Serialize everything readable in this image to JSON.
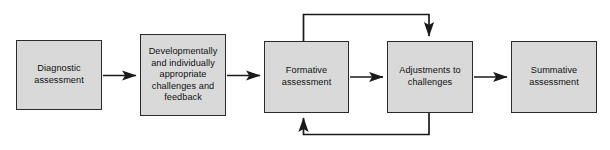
{
  "diagram": {
    "nodes": [
      {
        "id": "diagnostic",
        "label": "Diagnostic\nassessment"
      },
      {
        "id": "developmental",
        "label": "Developmentally\nand individually\nappropriate\nchallenges and\nfeedback"
      },
      {
        "id": "formative",
        "label": "Formative\nassessment"
      },
      {
        "id": "adjustments",
        "label": "Adjustments to\nchallenges"
      },
      {
        "id": "summative",
        "label": "Summative\nassessment"
      }
    ],
    "connectors": [
      {
        "id": "diagnostic-to-developmental",
        "from": "diagnostic",
        "to": "developmental",
        "kind": "straight-right"
      },
      {
        "id": "developmental-to-formative",
        "from": "developmental",
        "to": "formative",
        "kind": "straight-right"
      },
      {
        "id": "formative-to-adjustments",
        "from": "formative",
        "to": "adjustments",
        "kind": "straight-right"
      },
      {
        "id": "adjustments-to-summative",
        "from": "adjustments",
        "to": "summative",
        "kind": "straight-right"
      },
      {
        "id": "formative-to-adjustments-loop-top",
        "from": "formative",
        "to": "adjustments",
        "kind": "loop-over-top"
      },
      {
        "id": "adjustments-to-formative-loop-bottom",
        "from": "adjustments",
        "to": "formative",
        "kind": "loop-under-bottom"
      }
    ],
    "style": {
      "box_fill": "#d9d9d9",
      "box_border": "#2b2b2b",
      "line_color": "#222222",
      "text_color": "#111111",
      "background": "#ffffff"
    }
  }
}
